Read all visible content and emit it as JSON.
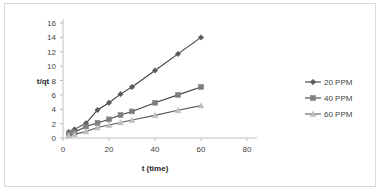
{
  "chart_data": {
    "type": "line",
    "title": "",
    "xlabel": "t (time)",
    "ylabel": "t/qt",
    "xlim": [
      0,
      80
    ],
    "ylim": [
      0,
      16
    ],
    "xticks": [
      0,
      20,
      40,
      60,
      80
    ],
    "yticks": [
      0,
      2,
      4,
      6,
      8,
      10,
      12,
      14,
      16
    ],
    "grid": false,
    "legend_position": "right",
    "series": [
      {
        "name": "20 PPM",
        "marker": "diamond",
        "color": "#595959",
        "line_color": "#404040",
        "x": [
          2.5,
          5,
          10,
          15,
          20,
          25,
          30,
          40,
          50,
          60
        ],
        "y": [
          0.85,
          1.2,
          2.05,
          3.9,
          4.9,
          6.1,
          7.1,
          9.4,
          11.7,
          14.0
        ]
      },
      {
        "name": "40 PPM",
        "marker": "square",
        "color": "#7f7f7f",
        "line_color": "#404040",
        "x": [
          2.5,
          5,
          10,
          15,
          20,
          25,
          30,
          40,
          50,
          60
        ],
        "y": [
          0.55,
          0.8,
          1.6,
          2.1,
          2.6,
          3.2,
          3.7,
          4.9,
          6.0,
          7.1
        ]
      },
      {
        "name": "60 PPM",
        "marker": "triangle",
        "color": "#bfbfbf",
        "line_color": "#595959",
        "x": [
          2.5,
          5,
          10,
          15,
          20,
          25,
          30,
          40,
          50,
          60
        ],
        "y": [
          0.3,
          0.5,
          0.9,
          1.45,
          1.8,
          2.15,
          2.5,
          3.15,
          3.85,
          4.5
        ]
      }
    ]
  },
  "legend": {
    "items": [
      {
        "label": "20 PPM"
      },
      {
        "label": "40 PPM"
      },
      {
        "label": "60 PPM"
      }
    ]
  },
  "axes": {
    "y_title": "t/qt",
    "x_title": "t (time)"
  },
  "colors": {
    "frame": "#d9d9d9",
    "axis": "#bfbfbf",
    "text": "#3f3f3f",
    "series_20ppm": "#595959",
    "series_40ppm": "#7f7f7f",
    "series_60ppm": "#bfbfbf"
  }
}
